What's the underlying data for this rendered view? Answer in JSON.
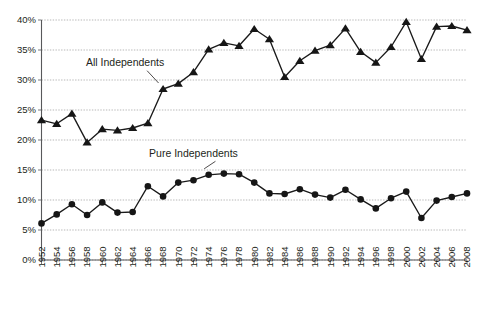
{
  "chart_data": {
    "type": "line",
    "title": "",
    "subtitle": "",
    "xlabel": "",
    "ylabel": "",
    "x": [
      1952,
      1954,
      1956,
      1958,
      1960,
      1962,
      1964,
      1966,
      1968,
      1970,
      1972,
      1974,
      1976,
      1978,
      1980,
      1982,
      1984,
      1986,
      1988,
      1990,
      1992,
      1994,
      1996,
      1998,
      2000,
      2002,
      2004,
      2006,
      2008
    ],
    "xtick_labels": [
      "1952",
      "1954",
      "1956",
      "1958",
      "1960",
      "1962",
      "1964",
      "1966",
      "1968",
      "1970",
      "1972",
      "1974",
      "1976",
      "1978",
      "1980",
      "1982",
      "1984",
      "1986",
      "1988",
      "1990",
      "1992",
      "1994",
      "1996",
      "1998",
      "2000",
      "2002",
      "2004",
      "2006",
      "2008"
    ],
    "ytick_labels": [
      "0%",
      "5%",
      "10%",
      "15%",
      "20%",
      "25%",
      "30%",
      "35%",
      "40%"
    ],
    "yticks": [
      0,
      5,
      10,
      15,
      20,
      25,
      30,
      35,
      40
    ],
    "ylim": [
      0,
      40
    ],
    "xlim": [
      1952,
      2008
    ],
    "grid": true,
    "grid_axis": "y",
    "legend": "annotations-on-plot",
    "series": [
      {
        "name": "All Independents",
        "marker": "triangle",
        "color": "#161616",
        "label_x": 1963.0,
        "label_y": 32.3,
        "values": [
          23.3,
          22.7,
          24.4,
          19.6,
          21.8,
          21.6,
          22.0,
          22.8,
          28.5,
          29.4,
          31.3,
          35.1,
          36.2,
          35.7,
          38.5,
          36.8,
          30.5,
          33.2,
          34.9,
          35.8,
          38.6,
          34.7,
          32.9,
          35.5,
          39.7,
          33.5,
          38.9,
          39.0,
          38.3
        ],
        "ylabel_suffix": "%"
      },
      {
        "name": "Pure Independents",
        "marker": "circle",
        "color": "#161616",
        "label_x": 1972.0,
        "label_y": 17.2,
        "values": [
          6.1,
          7.6,
          9.3,
          7.5,
          9.6,
          7.9,
          8.0,
          12.3,
          10.6,
          12.9,
          13.3,
          14.2,
          14.4,
          14.3,
          12.9,
          11.1,
          11.0,
          11.8,
          10.9,
          10.4,
          11.7,
          10.1,
          8.6,
          10.3,
          11.4,
          7.0,
          9.9,
          10.5,
          11.1
        ],
        "ylabel_suffix": "%"
      }
    ]
  }
}
